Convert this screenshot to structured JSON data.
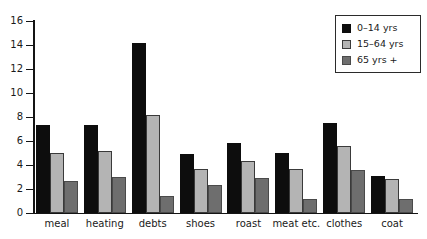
{
  "top_caption_remnant": "",
  "chart_data": {
    "type": "bar",
    "title": "",
    "xlabel": "",
    "ylabel": "",
    "ylim": [
      0,
      16
    ],
    "y_ticks": [
      0,
      2,
      4,
      6,
      8,
      10,
      12,
      14,
      16
    ],
    "grid": false,
    "legend_position": "top-right",
    "categories": [
      "meal",
      "heating",
      "debts",
      "shoes",
      "roast",
      "meat etc.",
      "clothes",
      "coat"
    ],
    "series": [
      {
        "name": "0–14 yrs",
        "color": "#0d0d0d",
        "values": [
          7.3,
          7.3,
          14.2,
          4.9,
          5.8,
          5.0,
          7.5,
          3.1
        ]
      },
      {
        "name": "15–64 yrs",
        "color": "#b4b4b4",
        "values": [
          5.0,
          5.2,
          8.2,
          3.7,
          4.3,
          3.7,
          5.6,
          2.8
        ]
      },
      {
        "name": "65 yrs +",
        "color": "#6e6e6e",
        "values": [
          2.7,
          3.0,
          1.4,
          2.3,
          2.9,
          1.2,
          3.6,
          1.2
        ]
      }
    ]
  }
}
